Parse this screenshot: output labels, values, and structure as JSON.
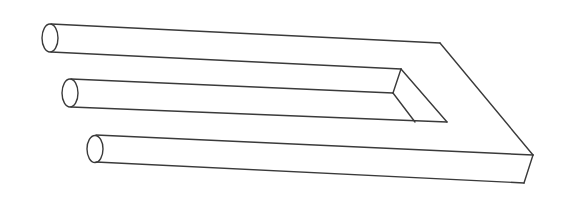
{
  "figure": {
    "title": "Impossible trident (blivet) line drawing",
    "background": "#ffffff",
    "stroke_color": "#3a3a3a",
    "stroke_width": 1.4,
    "cylinders": [
      {
        "name": "top-prong",
        "cx": 50,
        "cy": 38,
        "rx": 8,
        "ry": 14
      },
      {
        "name": "middle-prong",
        "cx": 70,
        "cy": 93,
        "rx": 8,
        "ry": 14
      },
      {
        "name": "bottom-prong",
        "cx": 95,
        "cy": 149,
        "rx": 8,
        "ry": 13.5
      }
    ],
    "lines": [
      {
        "name": "top-outer-edge",
        "x1": 51,
        "y1": 24,
        "x2": 440,
        "y2": 43
      },
      {
        "name": "top-prong-lower-edge",
        "x1": 51,
        "y1": 52,
        "x2": 401,
        "y2": 69
      },
      {
        "name": "middle-prong-upper-edge",
        "x1": 71,
        "y1": 79,
        "x2": 393,
        "y2": 93
      },
      {
        "name": "middle-prong-lower-edge",
        "x1": 71,
        "y1": 107,
        "x2": 447,
        "y2": 122
      },
      {
        "name": "bottom-prong-upper-edge",
        "x1": 96,
        "y1": 135,
        "x2": 533,
        "y2": 155
      },
      {
        "name": "bottom-prong-lower-edge",
        "x1": 96,
        "y1": 162,
        "x2": 524,
        "y2": 183
      },
      {
        "name": "outer-diagonal",
        "x1": 440,
        "y1": 43,
        "x2": 533,
        "y2": 155
      },
      {
        "name": "inner-diagonal-long",
        "x1": 401,
        "y1": 69,
        "x2": 447,
        "y2": 122
      },
      {
        "name": "inner-notch-vertical",
        "x1": 401,
        "y1": 69,
        "x2": 393,
        "y2": 93
      },
      {
        "name": "inner-diagonal-short",
        "x1": 393,
        "y1": 93,
        "x2": 415,
        "y2": 122
      },
      {
        "name": "end-face-edge",
        "x1": 533,
        "y1": 155,
        "x2": 524,
        "y2": 183
      }
    ]
  }
}
